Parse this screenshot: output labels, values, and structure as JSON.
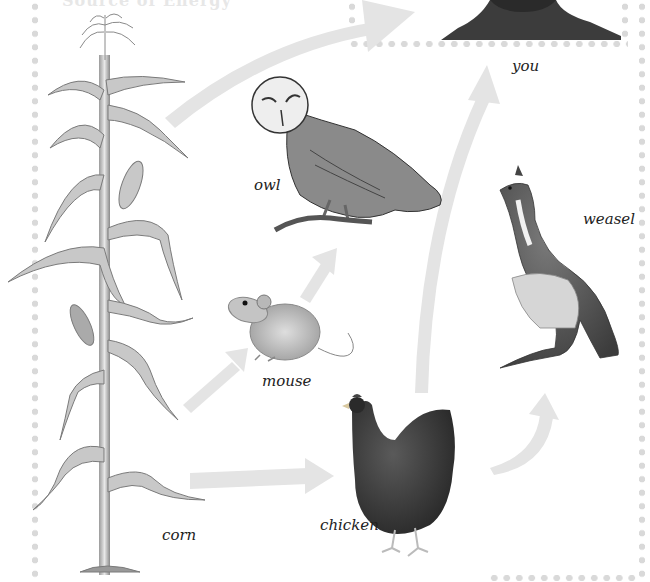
{
  "diagram": {
    "type": "food-web",
    "title_fragment": "Source of Energy",
    "organisms": [
      {
        "id": "corn",
        "label": "corn",
        "role": "producer"
      },
      {
        "id": "mouse",
        "label": "mouse",
        "role": "consumer"
      },
      {
        "id": "owl",
        "label": "owl",
        "role": "consumer"
      },
      {
        "id": "chicken",
        "label": "chicken",
        "role": "consumer"
      },
      {
        "id": "weasel",
        "label": "weasel",
        "role": "consumer"
      },
      {
        "id": "you",
        "label": "you",
        "role": "consumer"
      }
    ],
    "arrows": [
      {
        "from": "corn",
        "to": "you"
      },
      {
        "from": "corn",
        "to": "mouse"
      },
      {
        "from": "corn",
        "to": "chicken"
      },
      {
        "from": "mouse",
        "to": "owl"
      },
      {
        "from": "chicken",
        "to": "you"
      },
      {
        "from": "chicken",
        "to": "weasel"
      }
    ],
    "colors": {
      "arrow": "#e4e4e4",
      "border_dots": "#d9d9d9",
      "label_text": "#222222",
      "photo_dark": "#3a3a3a"
    }
  }
}
